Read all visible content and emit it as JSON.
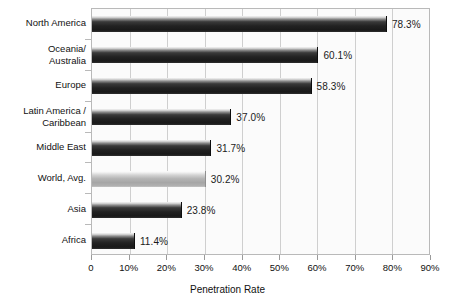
{
  "chart_data": {
    "type": "bar",
    "orientation": "horizontal",
    "title": "",
    "xlabel": "Penetration Rate",
    "ylabel": "",
    "xlim": [
      0,
      90
    ],
    "xticks": [
      0,
      10,
      20,
      30,
      40,
      50,
      60,
      70,
      80,
      90
    ],
    "xtick_labels": [
      "0",
      "10%",
      "20%",
      "30%",
      "40%",
      "50%",
      "60%",
      "70%",
      "80%",
      "90%"
    ],
    "grid": "vertical",
    "legend": "none",
    "categories": [
      "North America",
      "Oceania/\nAustralia",
      "Europe",
      "Latin America /\nCaribbean",
      "Middle East",
      "World, Avg.",
      "Asia",
      "Africa"
    ],
    "values": [
      78.3,
      60.1,
      58.3,
      37.0,
      31.7,
      30.2,
      23.8,
      11.4
    ],
    "value_labels": [
      "78.3%",
      "60.1%",
      "58.3%",
      "37.0%",
      "31.7%",
      "30.2%",
      "23.8%",
      "11.4%"
    ],
    "bar_styles": [
      "dark",
      "dark",
      "dark",
      "dark",
      "dark",
      "light",
      "dark",
      "dark"
    ],
    "colors": {
      "bar_dark": "#1f1f1f",
      "bar_light": "#b4b4b4",
      "gridline": "#cfcfcf",
      "frame": "#b9b9b9",
      "text": "#111111",
      "plot_background": "#fbfbfb",
      "page_background": "#ffffff"
    }
  }
}
